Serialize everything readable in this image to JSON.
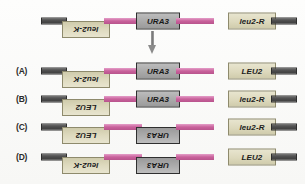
{
  "figure": {
    "colors": {
      "gene_cream": "#ddd9bd",
      "gene_grey": "#a9a9a9",
      "backbone_pink": "#c9619b",
      "terminal_bar_grey": "#4d4d4d",
      "arrow_grey": "#8b8b8b",
      "background": "#fbfbfa"
    },
    "arrow": {
      "name": "down-arrow",
      "direction": "down"
    },
    "rows": [
      {
        "label": "",
        "left_gene": {
          "text": "leu2-K",
          "style": "cream",
          "flipped": true
        },
        "middle_gene": {
          "text": "URA3",
          "style": "grey",
          "flipped": false
        },
        "right_gene": {
          "text": "leu2-R",
          "style": "cream",
          "flipped": false
        }
      },
      {
        "label": "(A)",
        "left_gene": {
          "text": "leu2-K",
          "style": "cream",
          "flipped": true
        },
        "middle_gene": {
          "text": "URA3",
          "style": "grey",
          "flipped": false
        },
        "right_gene": {
          "text": "LEU2",
          "style": "cream",
          "flipped": false
        }
      },
      {
        "label": "(B)",
        "left_gene": {
          "text": "LEU2",
          "style": "cream",
          "flipped": true
        },
        "middle_gene": {
          "text": "URA3",
          "style": "grey",
          "flipped": false
        },
        "right_gene": {
          "text": "leu2-R",
          "style": "cream",
          "flipped": false
        }
      },
      {
        "label": "(C)",
        "left_gene": {
          "text": "LEU2",
          "style": "cream",
          "flipped": true
        },
        "middle_gene": {
          "text": "URA3",
          "style": "grey",
          "flipped": true
        },
        "right_gene": {
          "text": "leu2-R",
          "style": "cream",
          "flipped": false
        }
      },
      {
        "label": "(D)",
        "left_gene": {
          "text": "leu2-K",
          "style": "cream",
          "flipped": true
        },
        "middle_gene": {
          "text": "URA3",
          "style": "grey",
          "flipped": true
        },
        "right_gene": {
          "text": "LEU2",
          "style": "cream",
          "flipped": false
        }
      }
    ]
  }
}
